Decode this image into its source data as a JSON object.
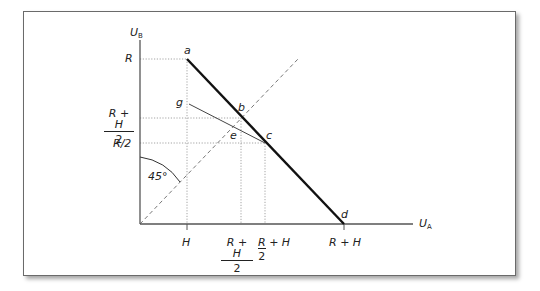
{
  "figure": {
    "axes": {
      "y_label": "U",
      "y_label_sub": "B",
      "x_label": "U",
      "x_label_sub": "A"
    },
    "y_ticks": [
      {
        "label": "R"
      },
      {
        "num": "R + H",
        "den": "2"
      },
      {
        "label": "R/2"
      }
    ],
    "x_ticks": [
      {
        "label": "H"
      },
      {
        "num": "R + H",
        "den": "2"
      },
      {
        "num": "R",
        "den": "2",
        "rest": "+ H"
      },
      {
        "label": "R + H"
      }
    ],
    "points": {
      "a": "a",
      "b": "b",
      "c": "c",
      "d": "d",
      "e": "e",
      "g": "g"
    },
    "angle_label": "45°",
    "colors": {
      "frontier": "#111111",
      "line_g": "#444444",
      "dashed_45": "#777777",
      "guides": "#999999",
      "frame": "#6a6a6a"
    }
  }
}
